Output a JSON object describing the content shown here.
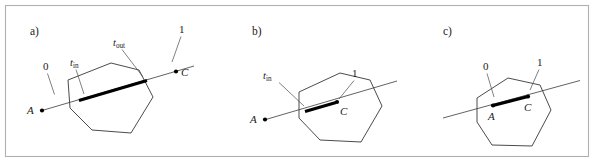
{
  "figure": {
    "type": "geometry-diagram",
    "background_color": "#ffffff",
    "frame_color": "#b0b0b0",
    "line_color": "#3a3a3a",
    "polygon_color": "#2b2b2b",
    "highlight_color": "#000000"
  },
  "panels": [
    {
      "id": "a",
      "label": "a)",
      "labels": {
        "start_point": "A",
        "end_point": "C",
        "param_zero": "0",
        "param_one": "1",
        "t_in": "t",
        "t_in_sub": "in",
        "t_out": "t",
        "t_out_sub": "out"
      },
      "polygon": "68,80 111,63 139,70 153,97 131,133 92,130 70,108",
      "ray": "42,110 194,66",
      "thick_segment": "79,101 147,81",
      "points": [
        {
          "name": "A",
          "x": 42,
          "y": 110
        },
        {
          "name": "C",
          "x": 176,
          "y": 71
        }
      ],
      "leaders": [
        {
          "name": "zero-leader",
          "path": "47,73 54,94"
        },
        {
          "name": "one-leader",
          "path": "182,33 172,61"
        },
        {
          "name": "t-in-leader",
          "path": "76,68 83,94"
        },
        {
          "name": "t-out-leader",
          "path": "122,48 143,76"
        }
      ]
    },
    {
      "id": "b",
      "label": "b)",
      "labels": {
        "start_point": "A",
        "end_point": "C",
        "param_one": "1",
        "t_in": "t",
        "t_in_sub": "in"
      },
      "polygon": "299,92 340,73 370,80 382,106 361,142 320,140 299,118",
      "ray": "264,120 394,82",
      "thick_segment": "305,112 334,103",
      "points": [
        {
          "name": "A",
          "x": 265,
          "y": 120
        },
        {
          "name": "C",
          "x": 337,
          "y": 101
        }
      ],
      "leaders": [
        {
          "name": "t-in-leader",
          "path": "278,81 303,105"
        },
        {
          "name": "one-leader",
          "path": "356,78 340,98"
        }
      ]
    },
    {
      "id": "c",
      "label": "c)",
      "labels": {
        "start_point": "A",
        "end_point": "C",
        "param_zero": "0",
        "param_one": "1",
        "t_in": "",
        "t_out": ""
      },
      "polygon": "477,98 508,78 540,85 551,110 532,146 492,145 477,122",
      "ray": "443,118 578,81",
      "thick_segment": "493,106 527,97",
      "points": [
        {
          "name": "A",
          "x": 493,
          "y": 106
        },
        {
          "name": "C",
          "x": 528,
          "y": 97
        }
      ],
      "leaders": [
        {
          "name": "zero-leader",
          "path": "487,73 494,96"
        },
        {
          "name": "one-leader",
          "path": "540,66 530,90"
        }
      ]
    }
  ]
}
